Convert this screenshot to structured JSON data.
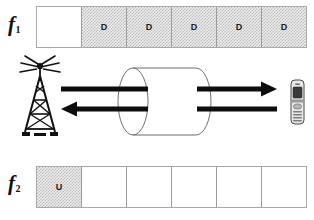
{
  "figure": {
    "type": "fdd-frame-structure-diagram",
    "rows": [
      {
        "id": "f1",
        "label_base": "f",
        "label_sub": "1",
        "direction": "downlink",
        "slots": [
          {
            "text": "",
            "shaded": false
          },
          {
            "text": "D",
            "shaded": true
          },
          {
            "text": "D",
            "shaded": true
          },
          {
            "text": "D",
            "shaded": true
          },
          {
            "text": "D",
            "shaded": true
          },
          {
            "text": "D",
            "shaded": true
          }
        ]
      },
      {
        "id": "f2",
        "label_base": "f",
        "label_sub": "2",
        "direction": "uplink",
        "slots": [
          {
            "text": "U",
            "shaded": true
          },
          {
            "text": "",
            "shaded": false
          },
          {
            "text": "",
            "shaded": false
          },
          {
            "text": "",
            "shaded": false
          },
          {
            "text": "",
            "shaded": false
          },
          {
            "text": "",
            "shaded": false
          }
        ]
      }
    ],
    "scene": {
      "base_station": "cell-tower-icon",
      "channel": "cylinder-pipe",
      "terminal": "mobile-phone-icon",
      "arrows": [
        {
          "name": "uplink-arrow-to-tower",
          "direction": "left"
        },
        {
          "name": "downlink-arrow-to-phone",
          "direction": "right"
        }
      ]
    },
    "caption": "",
    "colors": {
      "ink": "#111111",
      "slot_border": "#9a9a9a",
      "frame_border": "#a8a8a8",
      "shade_light": "#f0f0f0",
      "shade_dark": "#b9b9b9"
    }
  }
}
